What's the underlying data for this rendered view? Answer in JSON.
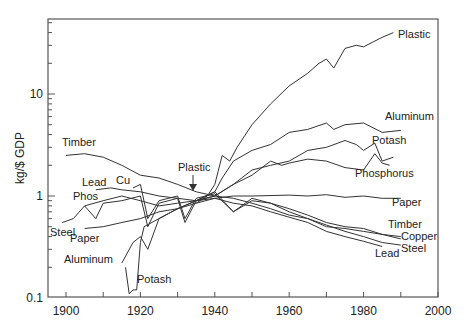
{
  "chart_data": {
    "type": "line",
    "title": "",
    "xlabel": "",
    "ylabel": "kg/$ GDP",
    "yscale": "log",
    "xlim": [
      1895,
      2000
    ],
    "ylim": [
      0.1,
      40
    ],
    "x_ticks": [
      1900,
      1920,
      1940,
      1960,
      1980,
      2000
    ],
    "y_ticks": [
      0.1,
      1,
      10
    ],
    "y_tick_labels": [
      "0.1",
      "1",
      "10"
    ],
    "grid": false,
    "legend": "inline labels",
    "annotations": [
      {
        "text": "Plastic",
        "x": 1935,
        "y": 1.25,
        "arrow": true
      }
    ],
    "series": [
      {
        "name": "Plastic",
        "points": [
          [
            1935,
            0.85
          ],
          [
            1938,
            1.0
          ],
          [
            1940,
            1.3
          ],
          [
            1942,
            2.5
          ],
          [
            1944,
            2.2
          ],
          [
            1946,
            3.0
          ],
          [
            1950,
            5.0
          ],
          [
            1955,
            8.0
          ],
          [
            1960,
            12
          ],
          [
            1965,
            16
          ],
          [
            1968,
            20
          ],
          [
            1970,
            22
          ],
          [
            1972,
            18
          ],
          [
            1975,
            28
          ],
          [
            1978,
            30
          ],
          [
            1980,
            29
          ],
          [
            1985,
            36
          ],
          [
            1988,
            40
          ]
        ]
      },
      {
        "name": "Aluminum",
        "points": [
          [
            1915,
            0.22
          ],
          [
            1918,
            0.35
          ],
          [
            1920,
            0.4
          ],
          [
            1922,
            0.3
          ],
          [
            1925,
            0.6
          ],
          [
            1930,
            0.75
          ],
          [
            1935,
            0.9
          ],
          [
            1940,
            1.1
          ],
          [
            1942,
            1.5
          ],
          [
            1945,
            2.2
          ],
          [
            1950,
            2.8
          ],
          [
            1955,
            3.2
          ],
          [
            1960,
            4.2
          ],
          [
            1965,
            4.5
          ],
          [
            1970,
            5.2
          ],
          [
            1972,
            4.5
          ],
          [
            1975,
            5.0
          ],
          [
            1980,
            5.2
          ],
          [
            1985,
            4.2
          ],
          [
            1990,
            4.4
          ]
        ]
      },
      {
        "name": "Potash",
        "points": [
          [
            1916,
            0.2
          ],
          [
            1917,
            0.11
          ],
          [
            1918,
            0.12
          ],
          [
            1919,
            0.12
          ],
          [
            1920,
            0.35
          ],
          [
            1921,
            0.5
          ],
          [
            1925,
            0.6
          ],
          [
            1930,
            0.75
          ],
          [
            1935,
            0.9
          ],
          [
            1940,
            1.0
          ],
          [
            1945,
            1.3
          ],
          [
            1950,
            1.8
          ],
          [
            1955,
            2.0
          ],
          [
            1960,
            2.2
          ],
          [
            1965,
            2.8
          ],
          [
            1970,
            3.0
          ],
          [
            1975,
            3.5
          ],
          [
            1978,
            3.2
          ],
          [
            1980,
            2.8
          ],
          [
            1983,
            3.3
          ],
          [
            1985,
            2.2
          ],
          [
            1988,
            2.4
          ]
        ]
      },
      {
        "name": "Phosphorus",
        "points": [
          [
            1905,
            0.8
          ],
          [
            1910,
            0.9
          ],
          [
            1915,
            1.0
          ],
          [
            1920,
            0.9
          ],
          [
            1925,
            0.8
          ],
          [
            1930,
            0.85
          ],
          [
            1935,
            0.9
          ],
          [
            1940,
            1.0
          ],
          [
            1945,
            1.3
          ],
          [
            1950,
            1.6
          ],
          [
            1955,
            2.2
          ],
          [
            1958,
            2.0
          ],
          [
            1960,
            2.1
          ],
          [
            1965,
            2.3
          ],
          [
            1970,
            2.2
          ],
          [
            1975,
            1.9
          ],
          [
            1980,
            1.8
          ],
          [
            1983,
            2.6
          ],
          [
            1985,
            2.1
          ],
          [
            1987,
            2.0
          ]
        ]
      },
      {
        "name": "Paper",
        "points": [
          [
            1905,
            0.48
          ],
          [
            1910,
            0.5
          ],
          [
            1915,
            0.55
          ],
          [
            1920,
            0.6
          ],
          [
            1925,
            0.7
          ],
          [
            1930,
            0.75
          ],
          [
            1935,
            0.85
          ],
          [
            1940,
            0.95
          ],
          [
            1945,
            1.0
          ],
          [
            1950,
            1.0
          ],
          [
            1960,
            1.02
          ],
          [
            1965,
            1.0
          ],
          [
            1970,
            1.03
          ],
          [
            1975,
            0.97
          ],
          [
            1980,
            1.0
          ],
          [
            1985,
            0.95
          ],
          [
            1990,
            0.95
          ]
        ]
      },
      {
        "name": "Timber",
        "points": [
          [
            1900,
            2.5
          ],
          [
            1905,
            2.6
          ],
          [
            1910,
            2.4
          ],
          [
            1915,
            2.0
          ],
          [
            1920,
            1.6
          ],
          [
            1925,
            1.5
          ],
          [
            1930,
            1.3
          ],
          [
            1935,
            1.1
          ],
          [
            1940,
            1.0
          ],
          [
            1945,
            0.95
          ],
          [
            1950,
            0.85
          ],
          [
            1955,
            0.75
          ],
          [
            1960,
            0.65
          ],
          [
            1965,
            0.6
          ],
          [
            1970,
            0.5
          ],
          [
            1975,
            0.48
          ],
          [
            1980,
            0.45
          ],
          [
            1985,
            0.42
          ],
          [
            1990,
            0.4
          ]
        ]
      },
      {
        "name": "Copper",
        "points": [
          [
            1918,
            1.2
          ],
          [
            1920,
            1.3
          ],
          [
            1922,
            0.6
          ],
          [
            1925,
            0.9
          ],
          [
            1930,
            1.0
          ],
          [
            1932,
            0.6
          ],
          [
            1935,
            0.95
          ],
          [
            1940,
            1.05
          ],
          [
            1945,
            0.7
          ],
          [
            1950,
            0.9
          ],
          [
            1955,
            0.85
          ],
          [
            1960,
            0.75
          ],
          [
            1965,
            0.65
          ],
          [
            1970,
            0.55
          ],
          [
            1975,
            0.5
          ],
          [
            1980,
            0.48
          ],
          [
            1985,
            0.42
          ],
          [
            1990,
            0.38
          ]
        ]
      },
      {
        "name": "Steel",
        "points": [
          [
            1899,
            0.55
          ],
          [
            1902,
            0.6
          ],
          [
            1905,
            0.8
          ],
          [
            1908,
            0.6
          ],
          [
            1910,
            0.85
          ],
          [
            1915,
            0.9
          ],
          [
            1920,
            1.0
          ],
          [
            1922,
            0.5
          ],
          [
            1925,
            0.85
          ],
          [
            1930,
            0.95
          ],
          [
            1932,
            0.55
          ],
          [
            1935,
            0.9
          ],
          [
            1940,
            1.1
          ],
          [
            1945,
            0.7
          ],
          [
            1950,
            0.95
          ],
          [
            1955,
            0.85
          ],
          [
            1960,
            0.7
          ],
          [
            1965,
            0.6
          ],
          [
            1970,
            0.52
          ],
          [
            1975,
            0.45
          ],
          [
            1980,
            0.4
          ],
          [
            1985,
            0.35
          ],
          [
            1990,
            0.33
          ]
        ]
      },
      {
        "name": "Lead",
        "points": [
          [
            1908,
            1.15
          ],
          [
            1912,
            1.2
          ],
          [
            1915,
            1.15
          ],
          [
            1920,
            1.1
          ],
          [
            1925,
            1.0
          ],
          [
            1930,
            0.95
          ],
          [
            1935,
            0.9
          ],
          [
            1940,
            0.95
          ],
          [
            1945,
            0.85
          ],
          [
            1950,
            0.8
          ],
          [
            1955,
            0.7
          ],
          [
            1960,
            0.62
          ],
          [
            1965,
            0.55
          ],
          [
            1970,
            0.45
          ],
          [
            1975,
            0.4
          ],
          [
            1980,
            0.36
          ],
          [
            1985,
            0.32
          ]
        ]
      }
    ],
    "labels": [
      {
        "text": "Plastic",
        "x": 398,
        "y": 38
      },
      {
        "text": "Aluminum",
        "x": 385,
        "y": 120
      },
      {
        "text": "Potash",
        "x": 372,
        "y": 144
      },
      {
        "text": "Phosphorus",
        "x": 355,
        "y": 177
      },
      {
        "text": "Paper",
        "x": 392,
        "y": 206
      },
      {
        "text": "Timber",
        "x": 388,
        "y": 228
      },
      {
        "text": "Copper",
        "x": 401,
        "y": 240
      },
      {
        "text": "Steel",
        "x": 401,
        "y": 252
      },
      {
        "text": "Lead",
        "x": 375,
        "y": 257
      },
      {
        "text": "Timber",
        "x": 62,
        "y": 146
      },
      {
        "text": "Lead",
        "x": 82,
        "y": 186
      },
      {
        "text": "Cu",
        "x": 116,
        "y": 184
      },
      {
        "text": "Phos",
        "x": 73,
        "y": 200
      },
      {
        "text": "Steel",
        "x": 50,
        "y": 236
      },
      {
        "text": "Paper",
        "x": 70,
        "y": 242
      },
      {
        "text": "Aluminum",
        "x": 64,
        "y": 263
      },
      {
        "text": "Potash",
        "x": 137,
        "y": 283
      },
      {
        "text": "Plastic",
        "x": 178,
        "y": 171
      }
    ]
  }
}
